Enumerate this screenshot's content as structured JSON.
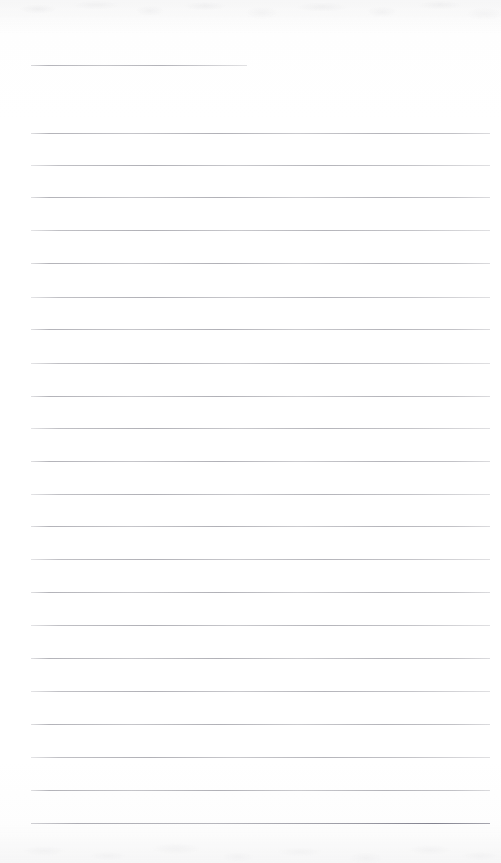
{
  "document": {
    "kind": "scanned-ruled-notebook-page",
    "title": "Blank ruled notebook page",
    "written_text": "",
    "page_width": 501,
    "page_height": 863,
    "background_color": "#fefefe",
    "rule_color": "#96969e",
    "texture": {
      "top_band_height": 34,
      "bottom_band_height": 40,
      "description": "faint scanner mottling along top and bottom edges"
    },
    "ruling": {
      "left_margin_x": 31,
      "right_edge_x": 490,
      "full_line_width": 459,
      "line_spacing": 32.8,
      "line_count": 23,
      "first_line_is_short": true,
      "short_line_end_x": 247,
      "short_line_width": 216
    }
  },
  "rules": [
    {
      "index": 1,
      "y": 65,
      "x": 31,
      "width": 216,
      "style": "short"
    },
    {
      "index": 2,
      "y": 132.7,
      "x": 31,
      "width": 459,
      "style": "normal"
    },
    {
      "index": 3,
      "y": 165,
      "x": 31,
      "width": 459,
      "style": "alt"
    },
    {
      "index": 4,
      "y": 197.3,
      "x": 31,
      "width": 459,
      "style": "normal"
    },
    {
      "index": 5,
      "y": 230,
      "x": 31,
      "width": 459,
      "style": "alt"
    },
    {
      "index": 6,
      "y": 263.3,
      "x": 31,
      "width": 459,
      "style": "normal"
    },
    {
      "index": 7,
      "y": 296.7,
      "x": 31,
      "width": 459,
      "style": "alt"
    },
    {
      "index": 8,
      "y": 329.3,
      "x": 31,
      "width": 459,
      "style": "normal"
    },
    {
      "index": 9,
      "y": 362.7,
      "x": 31,
      "width": 459,
      "style": "alt"
    },
    {
      "index": 10,
      "y": 395.7,
      "x": 31,
      "width": 459,
      "style": "normal"
    },
    {
      "index": 11,
      "y": 428,
      "x": 31,
      "width": 459,
      "style": "alt"
    },
    {
      "index": 12,
      "y": 461,
      "x": 31,
      "width": 459,
      "style": "normal"
    },
    {
      "index": 13,
      "y": 493.5,
      "x": 31,
      "width": 459,
      "style": "alt"
    },
    {
      "index": 14,
      "y": 526,
      "x": 31,
      "width": 459,
      "style": "normal"
    },
    {
      "index": 15,
      "y": 559,
      "x": 31,
      "width": 459,
      "style": "alt"
    },
    {
      "index": 16,
      "y": 591.5,
      "x": 31,
      "width": 459,
      "style": "normal"
    },
    {
      "index": 17,
      "y": 625,
      "x": 31,
      "width": 459,
      "style": "alt"
    },
    {
      "index": 18,
      "y": 658,
      "x": 31,
      "width": 459,
      "style": "normal"
    },
    {
      "index": 19,
      "y": 690.5,
      "x": 31,
      "width": 459,
      "style": "alt"
    },
    {
      "index": 20,
      "y": 724,
      "x": 31,
      "width": 459,
      "style": "normal"
    },
    {
      "index": 21,
      "y": 756.7,
      "x": 31,
      "width": 459,
      "style": "alt"
    },
    {
      "index": 22,
      "y": 790,
      "x": 31,
      "width": 459,
      "style": "normal"
    },
    {
      "index": 23,
      "y": 822.7,
      "x": 31,
      "width": 459,
      "style": "dark-right"
    }
  ]
}
